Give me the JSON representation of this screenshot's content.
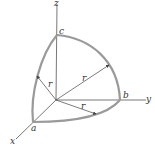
{
  "diagram": {
    "axes": {
      "x_label": "x",
      "y_label": "y",
      "z_label": "z"
    },
    "points": {
      "a_label": "a",
      "b_label": "b",
      "c_label": "c"
    },
    "radius_label": "r",
    "radius_labels": [
      "r",
      "r",
      "r"
    ],
    "colors": {
      "axis": "#555555",
      "arc": "#9a9a9a",
      "text": "#333333"
    }
  }
}
